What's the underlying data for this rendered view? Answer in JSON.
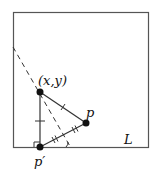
{
  "diagram": {
    "labels": {
      "point_xy": "(x,y)",
      "point_p": "p",
      "point_p_prime": "p′",
      "line": "L"
    },
    "colors": {
      "stroke": "#333333",
      "point": "#111111",
      "background": "#ffffff"
    }
  }
}
